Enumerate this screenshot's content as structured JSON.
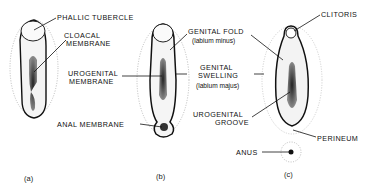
{
  "figure": {
    "panels": [
      {
        "caption": "(a)",
        "labels": [
          "PHALLIC TUBERCLE",
          "CLOACAL",
          "MEMBRANE"
        ]
      },
      {
        "caption": "(b)",
        "labels": [
          "GENITAL FOLD",
          "(labium minus)",
          "UROGENITAL",
          "MEMBRANE",
          "GENITAL",
          "SWELLING",
          "(labium majus)",
          "ANAL MEMBRANE",
          "UROGENITAL",
          "GROOVE"
        ]
      },
      {
        "caption": "(c)",
        "labels": [
          "CLITORIS",
          "PERINEUM",
          "ANUS"
        ]
      }
    ]
  }
}
